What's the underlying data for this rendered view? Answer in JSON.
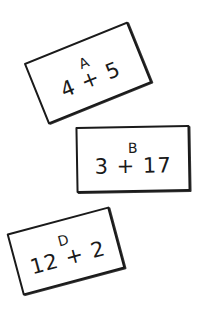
{
  "cards": [
    {
      "letter": "A",
      "expression": "4 + 5"
    },
    {
      "letter": "B",
      "expression": "3 + 17"
    },
    {
      "letter": "D",
      "expression": "12 + 2"
    }
  ],
  "colors": {
    "ink": "#1a1a1a",
    "background": "#ffffff"
  }
}
